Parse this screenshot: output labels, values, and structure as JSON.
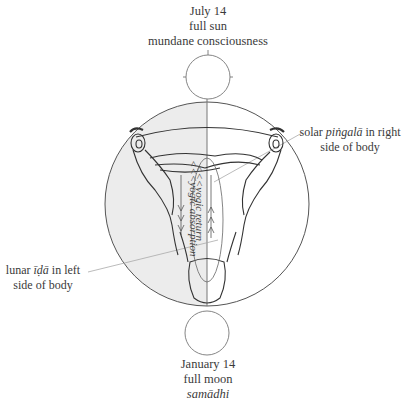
{
  "diagram": {
    "top_label": {
      "date": "July 14",
      "phase": "full sun",
      "state": "mundane consciousness"
    },
    "bottom_label": {
      "date": "January 14",
      "phase": "full moon",
      "state": "samādhi"
    },
    "right_label": {
      "prefix": "solar ",
      "term": "piṅgalā",
      "suffix": " in right",
      "line2": "side of body"
    },
    "left_label": {
      "prefix": "lunar ",
      "term": "īḍā",
      "suffix": " in left",
      "line2": "side of body"
    },
    "channel_labels": {
      "descending": "<<<yogic absorption",
      "ascending": "<<<yogic return"
    },
    "colors": {
      "shade": "#ececec",
      "line": "#555555",
      "leader": "#aaaaaa"
    }
  }
}
